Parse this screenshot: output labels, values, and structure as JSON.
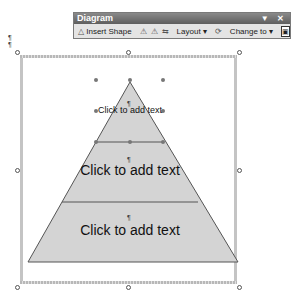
{
  "toolbar": {
    "title": "Diagram",
    "controls": "▼ ✕",
    "insert_shape": "Insert Shape",
    "layout": "Layout ▾",
    "change_to": "Change to ▾",
    "icons": [
      "move-shape-backward-icon",
      "move-shape-forward-icon",
      "reverse-diagram-icon",
      "autoformat-icon",
      "text-wrap-icon"
    ]
  },
  "paragraph_mark": "¶",
  "pyramid": {
    "top_label": "Click to add text",
    "middle_label": "Click to add text",
    "bottom_label": "Click to add text",
    "fill": "#d4d4d4",
    "stroke": "#555555"
  }
}
